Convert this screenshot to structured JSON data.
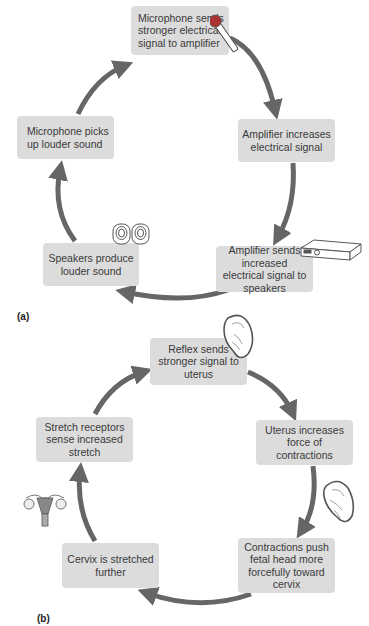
{
  "figure": {
    "panels": [
      {
        "label": "(a)",
        "steps": [
          {
            "text": "Microphone sends stronger electrical signal to amplifier",
            "icon": "microphone-icon"
          },
          {
            "text": "Amplifier increases electrical signal",
            "icon": null
          },
          {
            "text": "Amplifier sends increased electrical signal to speakers",
            "icon": "amplifier-icon"
          },
          {
            "text": "Speakers produce louder sound",
            "icon": "speakers-icon"
          },
          {
            "text": "Microphone picks up louder sound",
            "icon": null
          }
        ],
        "flow": "clockwise"
      },
      {
        "label": "(b)",
        "steps": [
          {
            "text": "Reflex sends stronger signal to uterus",
            "icon": "fetus-in-uterus-icon"
          },
          {
            "text": "Uterus increases force of contractions",
            "icon": null
          },
          {
            "text": "Contractions push fetal head more forcefully toward cervix",
            "icon": "fetus-in-uterus-icon"
          },
          {
            "text": "Cervix is stretched further",
            "icon": null
          },
          {
            "text": "Stretch receptors sense increased stretch",
            "icon": "uterus-anatomy-icon"
          }
        ],
        "flow": "clockwise"
      }
    ],
    "colors": {
      "box_fill": "#dcdcdc",
      "arrow": "#666666",
      "text": "#3a3a3a"
    }
  }
}
